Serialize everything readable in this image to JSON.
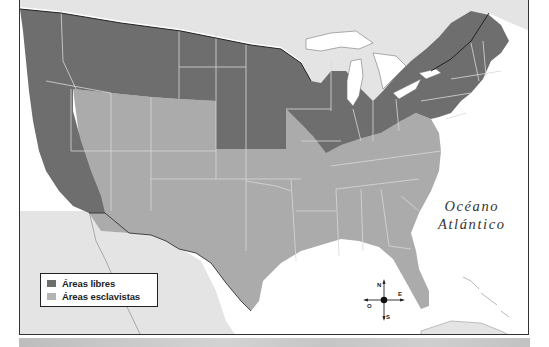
{
  "map": {
    "title": "",
    "region": "Estados Unidos",
    "colors": {
      "free": "#6e6e6e",
      "slave": "#a9a9a9",
      "foreign_land": "#e4e4e4",
      "water": "#ffffff",
      "border": "#d8d8d8",
      "frame": "#333333"
    }
  },
  "legend": {
    "items": [
      {
        "label": "Áreas libres",
        "color": "#6e6e6e"
      },
      {
        "label": "Áreas esclavistas",
        "color": "#b4b4b4"
      }
    ]
  },
  "labels": {
    "ocean_line1": "Océano",
    "ocean_line2": "Atlántico"
  },
  "compass": {
    "north": "N",
    "south": "S",
    "east": "E",
    "west": "O"
  }
}
